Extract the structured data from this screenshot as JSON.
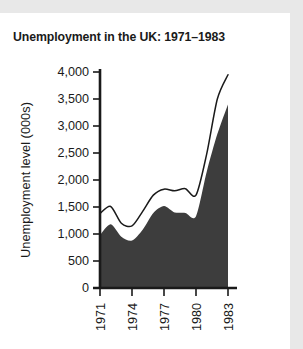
{
  "figure": {
    "title": "Unemployment in the UK: 1971–1983",
    "card_background": "#ffffff",
    "page_background": "#e8e8e8"
  },
  "chart_data": {
    "type": "area",
    "title": "Unemployment in the UK: 1971–1983",
    "xlabel": "",
    "ylabel": "Unemployment level (000s)",
    "xlim": [
      1971,
      1983
    ],
    "ylim": [
      0,
      4000
    ],
    "grid": false,
    "legend": "none",
    "x_tick_labels": [
      "1971",
      "1974",
      "1977",
      "1980",
      "1983"
    ],
    "x_tick_values": [
      1971,
      1974,
      1977,
      1980,
      1983
    ],
    "y_tick_labels": [
      "0",
      "500",
      "1,000",
      "1,500",
      "2,000",
      "2,500",
      "3,000",
      "3,500",
      "4,000"
    ],
    "y_tick_values": [
      0,
      500,
      1000,
      1500,
      2000,
      2500,
      3000,
      3500,
      4000
    ],
    "x": [
      1971,
      1972,
      1973,
      1974,
      1975,
      1976,
      1977,
      1978,
      1979,
      1980,
      1981,
      1982,
      1983
    ],
    "series": [
      {
        "name": "upper-line",
        "render": "line",
        "color": "#1a1a1a",
        "values": [
          1380,
          1510,
          1200,
          1150,
          1420,
          1720,
          1830,
          1800,
          1840,
          1720,
          2480,
          3500,
          3950
        ]
      },
      {
        "name": "filled-area",
        "render": "area",
        "color": "#3d3d3d",
        "values": [
          980,
          1180,
          950,
          880,
          1080,
          1390,
          1520,
          1400,
          1390,
          1330,
          2150,
          2850,
          3400
        ]
      }
    ]
  }
}
